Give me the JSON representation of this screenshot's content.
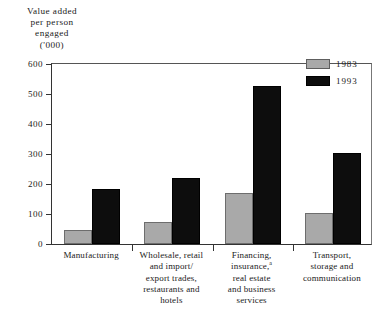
{
  "chart_data": {
    "type": "bar",
    "title": "",
    "ylabel": "Value added\nper person\nengaged\n('000)",
    "xlabel": "",
    "ylim": [
      0,
      600
    ],
    "yticks": [
      600,
      500,
      400,
      300,
      200,
      100,
      0
    ],
    "ytick_labels": [
      "600",
      "500",
      "400",
      "300",
      "200",
      "100",
      "0"
    ],
    "grid": false,
    "legend_position": "top-right",
    "categories": [
      "Manufacturing",
      "Wholesale, retail\nand import/\nexport trades,\nrestaurants and\nhotels",
      "Financing,\ninsurance,|a|\nreal estate\nand business\nservices",
      "Transport,\nstorage and\ncommunication"
    ],
    "series": [
      {
        "name": "1983",
        "color": "#a9a9a9",
        "values": [
          48,
          75,
          171,
          104
        ]
      },
      {
        "name": "1993",
        "color": "#0d0d0d",
        "values": [
          183,
          219,
          527,
          303
        ]
      }
    ],
    "footnote_marker": "a"
  },
  "legend": {
    "items": [
      {
        "label": "1983",
        "color": "#a9a9a9"
      },
      {
        "label": "1993",
        "color": "#0d0d0d"
      }
    ]
  }
}
